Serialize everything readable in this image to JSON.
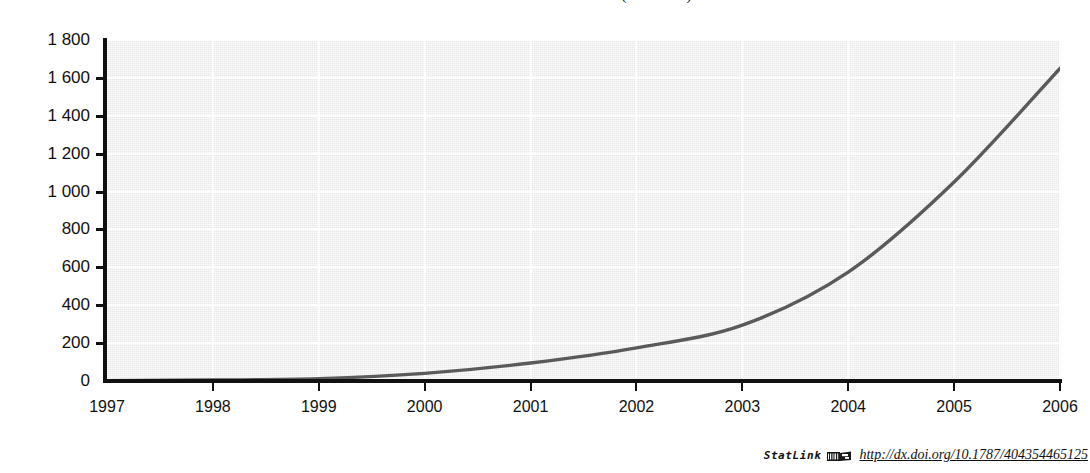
{
  "chart_data": {
    "type": "line",
    "title": "Broadband subscribers in the OECD (thousands)",
    "xlabel": "",
    "ylabel": "",
    "x": [
      1997,
      1998,
      1999,
      2000,
      2001,
      2002,
      2003,
      2004,
      2005,
      2006
    ],
    "categories": [
      "1997",
      "1998",
      "1999",
      "2000",
      "2001",
      "2002",
      "2003",
      "2004",
      "2005",
      "2006"
    ],
    "values": [
      2,
      5,
      12,
      40,
      95,
      175,
      295,
      575,
      1050,
      1650
    ],
    "series": [
      {
        "name": "series-1",
        "values": [
          2,
          5,
          12,
          40,
          95,
          175,
          295,
          575,
          1050,
          1650
        ],
        "color": "#5a5a5a"
      }
    ],
    "ylim": [
      0,
      1800
    ],
    "yticks": [
      0,
      200,
      400,
      600,
      800,
      1000,
      1200,
      1400,
      1600,
      1800
    ],
    "ytick_labels": [
      "0",
      "200",
      "400",
      "600",
      "800",
      "1 000",
      "1 200",
      "1 400",
      "1 600",
      "1 800"
    ],
    "xticks": [
      1997,
      1998,
      1999,
      2000,
      2001,
      2002,
      2003,
      2004,
      2005,
      2006
    ],
    "xtick_labels": [
      "1997",
      "1998",
      "1999",
      "2000",
      "2001",
      "2002",
      "2003",
      "2004",
      "2005",
      "2006"
    ],
    "grid": true,
    "grid_color": "#ffffff",
    "plot_background": "#e9e9e9",
    "legend": false,
    "legend_position": "none"
  },
  "footer": {
    "statlink_label": "StatLink",
    "statlink_icon": "statlink-barcode-icon",
    "url": "http://dx.doi.org/10.1787/404354465125"
  },
  "colors": {
    "line": "#5a5a5a",
    "axis": "#111111",
    "grid": "#ffffff",
    "plot_bg": "#e9e9e9",
    "page_bg": "#ffffff",
    "text": "#111111"
  }
}
